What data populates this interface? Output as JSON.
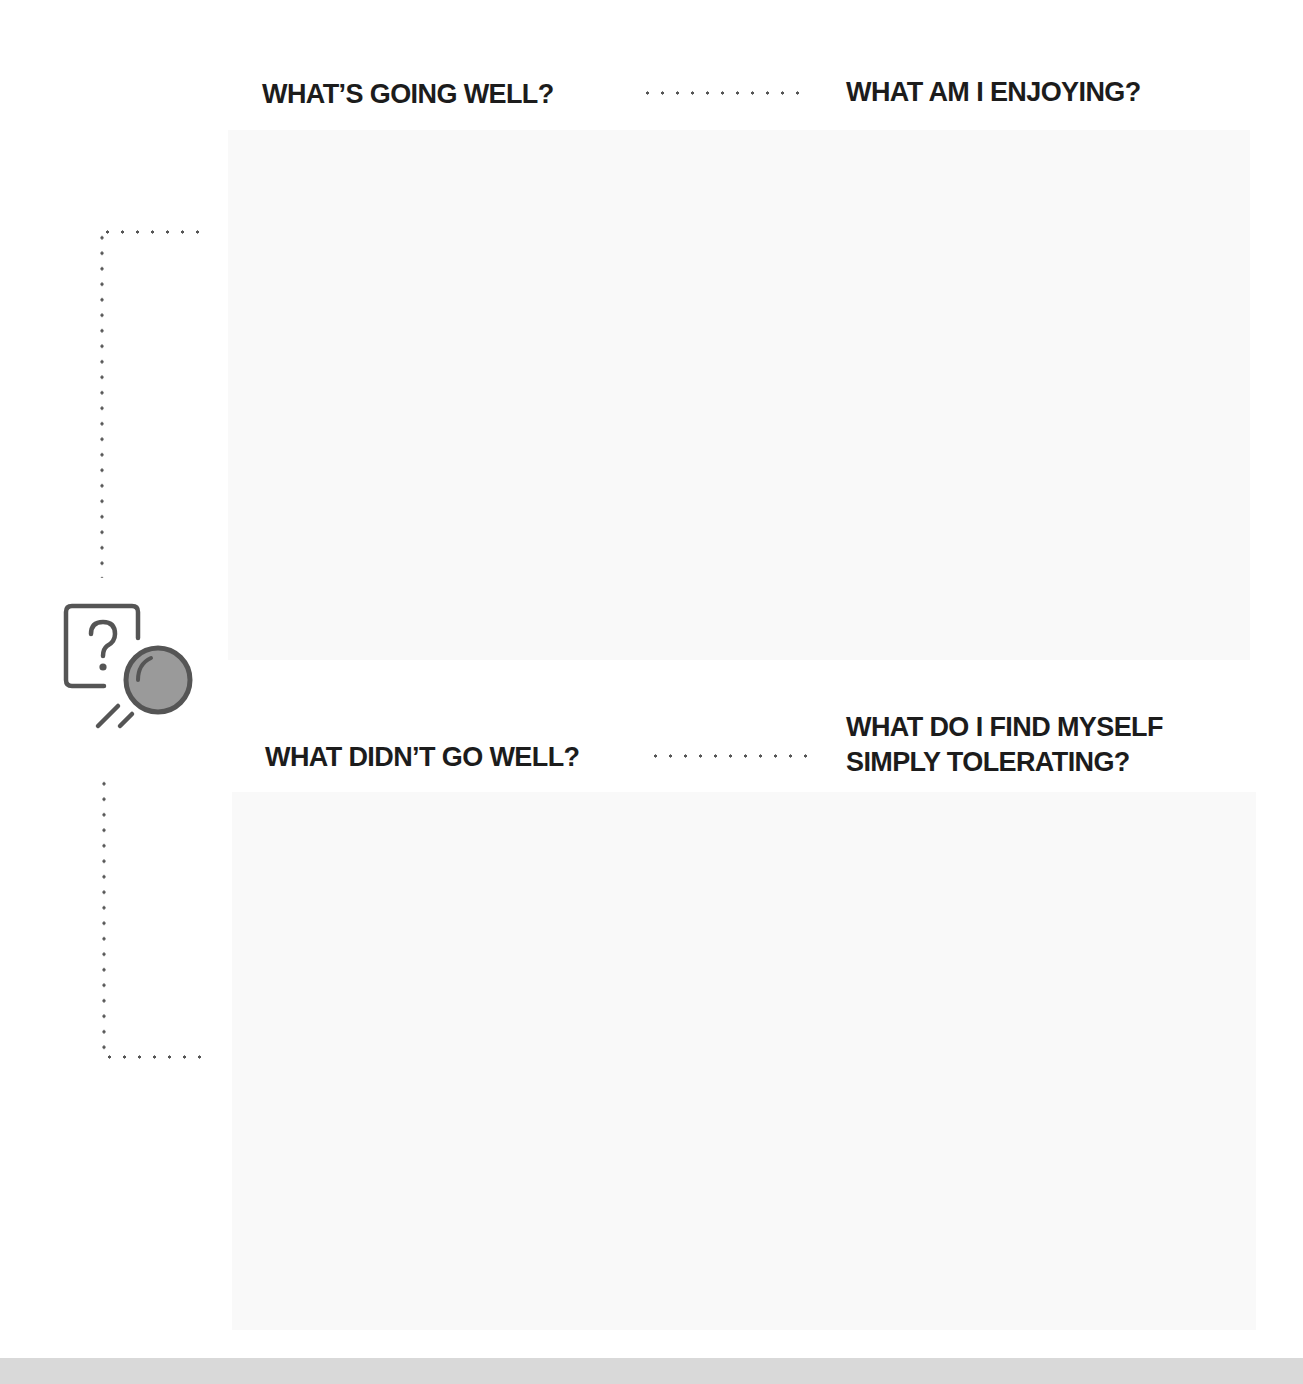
{
  "worksheet": {
    "top_section": {
      "left_heading": "WHAT’S GOING WELL?",
      "right_heading": "WHAT AM I ENJOYING?",
      "answer_value": ""
    },
    "bottom_section": {
      "left_heading": "WHAT DIDN’T GO WELL?",
      "right_heading_line1": "WHAT DO I FIND MYSELF",
      "right_heading_line2": "SIMPLY TOLERATING?",
      "answer_value": ""
    },
    "icon": "question-card-magnifier-icon"
  },
  "colors": {
    "heading_text": "#1c1c1c",
    "dots": "#555555",
    "answer_box": "#f9f9f9",
    "icon_stroke": "#555555",
    "icon_lens_fill": "#9a9a9a",
    "footer_band": "#d9d9d9"
  }
}
